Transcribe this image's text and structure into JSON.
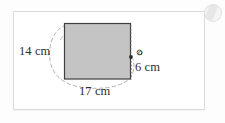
{
  "figure": {
    "type": "geometry-diagram",
    "shape": "rectangle",
    "fill_color": "#c4c4c4",
    "stroke_color": "#444444",
    "dashed_arc_color": "#9a9a9a",
    "labels": {
      "left": "14 cm",
      "right": "6 cm",
      "bottom": "17 cm",
      "vertex": "o"
    },
    "measurements": [
      {
        "side": "left",
        "value": 14,
        "unit": "cm",
        "text": "14 cm"
      },
      {
        "side": "bottom",
        "value": 17,
        "unit": "cm",
        "text": "17 cm"
      },
      {
        "side": "right",
        "value": 6,
        "unit": "cm",
        "text": "6 cm"
      }
    ]
  },
  "watermark": {
    "icon": "circular-watermark-icon"
  }
}
